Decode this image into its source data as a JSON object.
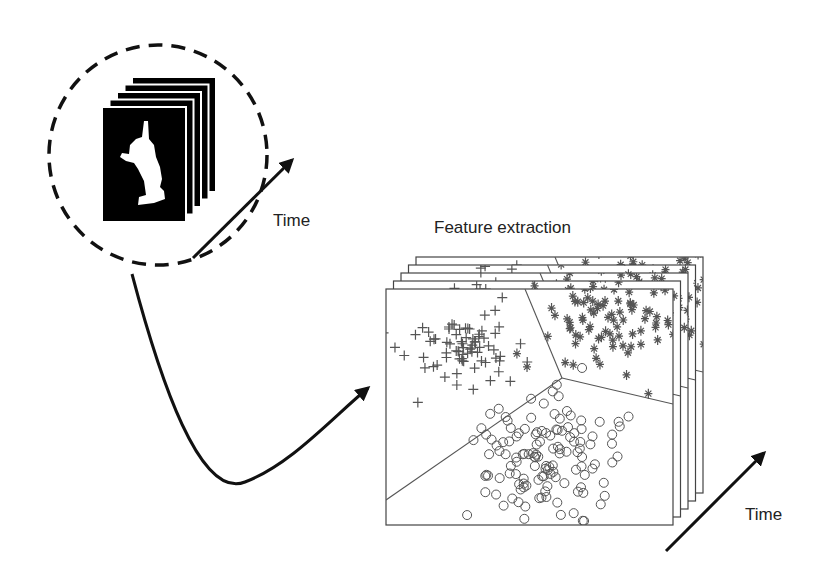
{
  "labels": {
    "time_top": "Time",
    "feature_extraction": "Feature extraction",
    "time_bottom": "Time"
  },
  "colors": {
    "ink": "#111111",
    "frame_line": "#444444",
    "marker": "#555555",
    "background": "#ffffff"
  },
  "silhouette_stack": {
    "frame_count": 5,
    "front_frame": {
      "x": 102,
      "y": 107,
      "w": 84,
      "h": 115
    },
    "offset": {
      "dx": 7.5,
      "dy": -7.5
    }
  },
  "plot_stack": {
    "frame_count": 5,
    "front_frame": {
      "x": 386,
      "y": 289,
      "w": 287,
      "h": 236
    },
    "offset": {
      "dx": 7.5,
      "dy": -8
    }
  },
  "chart_data": {
    "type": "scatter",
    "title": "Feature extraction",
    "series": [
      {
        "name": "class-plus",
        "marker": "+",
        "region": "upper-left"
      },
      {
        "name": "class-star",
        "marker": "*",
        "region": "upper-right"
      },
      {
        "name": "class-circle",
        "marker": "o",
        "region": "bottom"
      }
    ],
    "boundaries": [
      [
        [
          525,
          289
        ],
        [
          562,
          378
        ]
      ],
      [
        [
          562,
          378
        ],
        [
          673,
          404
        ]
      ],
      [
        [
          562,
          378
        ],
        [
          386,
          500
        ]
      ]
    ],
    "axes": {
      "grid": false,
      "ticks": false
    }
  }
}
